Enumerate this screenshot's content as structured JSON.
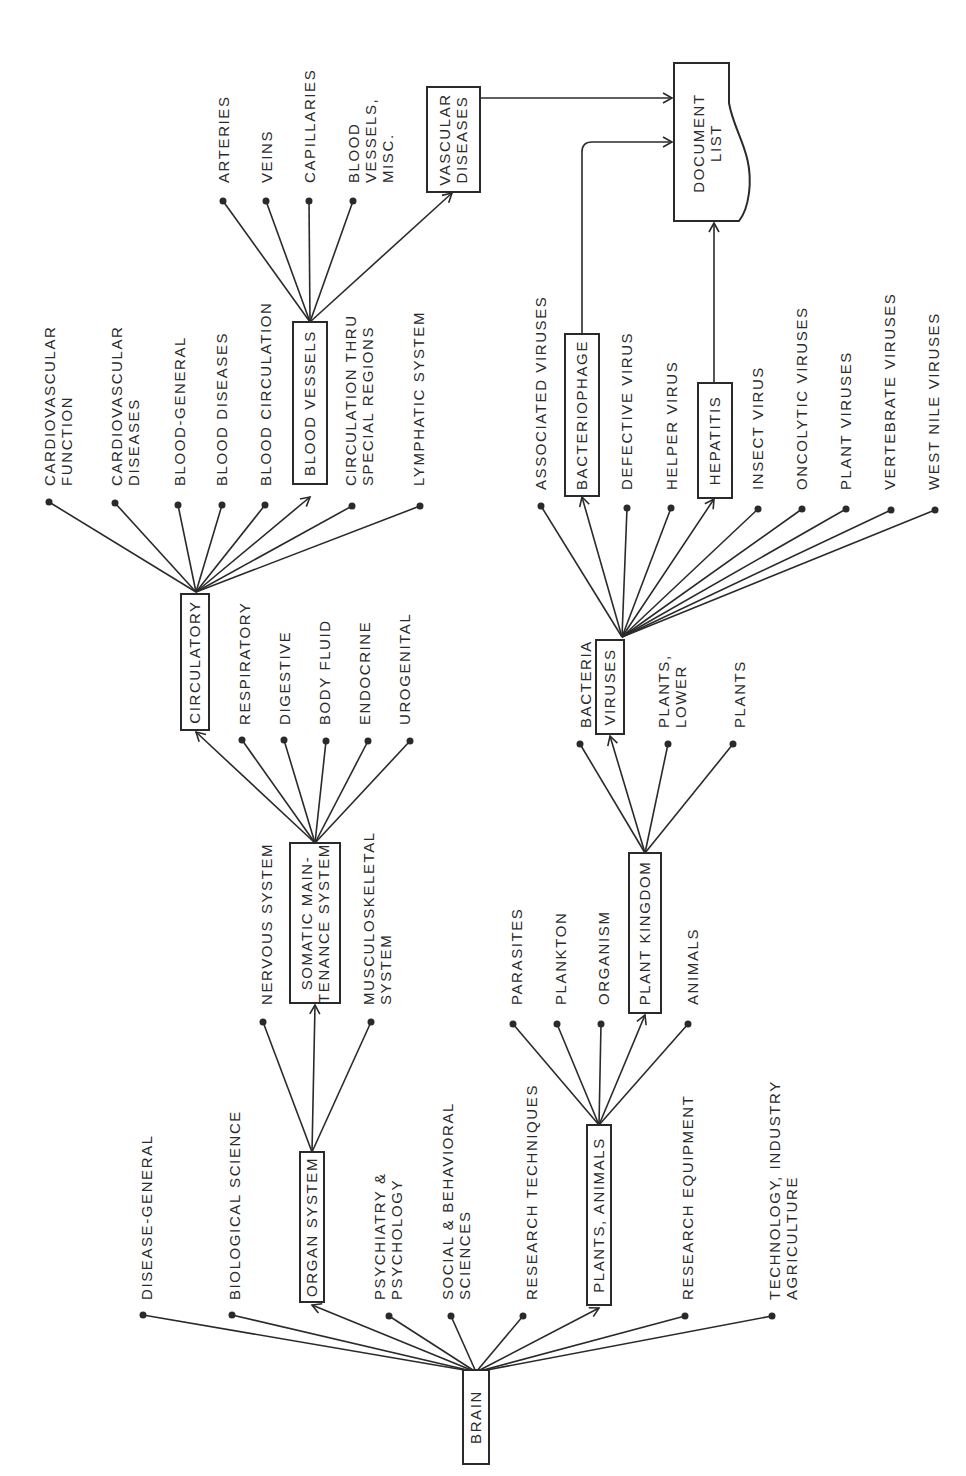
{
  "diagram": {
    "orientation": "rotated 90 degrees counter-clockwise",
    "root": {
      "id": "brain",
      "label": "BRAIN",
      "x": 476,
      "y": 1425
    },
    "boxed_nodes": [
      {
        "id": "brain",
        "lines": [
          "BRAIN"
        ],
        "x": 463,
        "y": 1370,
        "w": 26,
        "h": 94
      },
      {
        "id": "organ-system",
        "lines": [
          "ORGAN SYSTEM"
        ],
        "x": 300,
        "y": 1152,
        "w": 24,
        "h": 150
      },
      {
        "id": "plants-animals",
        "lines": [
          "PLANTS, ANIMALS"
        ],
        "x": 587,
        "y": 1125,
        "w": 24,
        "h": 180
      },
      {
        "id": "somatic",
        "lines": [
          "SOMATIC MAIN-",
          "TENANCE SYSTEM"
        ],
        "x": 290,
        "y": 843,
        "w": 50,
        "h": 160
      },
      {
        "id": "plant-kingdom",
        "lines": [
          "PLANT KINGDOM"
        ],
        "x": 629,
        "y": 853,
        "w": 32,
        "h": 160
      },
      {
        "id": "circulatory",
        "lines": [
          "CIRCULATORY"
        ],
        "x": 181,
        "y": 594,
        "w": 28,
        "h": 136
      },
      {
        "id": "viruses",
        "lines": [
          "VIRUSES"
        ],
        "x": 596,
        "y": 640,
        "w": 28,
        "h": 94
      },
      {
        "id": "blood-vessels",
        "lines": [
          "BLOOD VESSELS"
        ],
        "x": 293,
        "y": 322,
        "w": 34,
        "h": 162
      },
      {
        "id": "bacteriophage",
        "lines": [
          "BACTERIOPHAGE"
        ],
        "x": 565,
        "y": 334,
        "w": 34,
        "h": 162
      },
      {
        "id": "hepatitis",
        "lines": [
          "HEPATITIS"
        ],
        "x": 698,
        "y": 383,
        "w": 34,
        "h": 115
      },
      {
        "id": "vascular-diseases",
        "lines": [
          "VASCULAR",
          "DISEASES"
        ],
        "x": 427,
        "y": 87,
        "w": 53,
        "h": 105
      }
    ],
    "document_list": {
      "lines": [
        "DOCUMENT",
        "LIST"
      ],
      "x": 674,
      "y": 63,
      "w": 75,
      "h": 158
    },
    "groups": [
      {
        "parent": "brain",
        "hub": [
          476,
          1372
        ],
        "children": [
          {
            "lines": [
              "DISEASE-GENERAL"
            ],
            "tip": [
              143,
              1315
            ],
            "tx": 152,
            "ty": 1300
          },
          {
            "lines": [
              "BIOLOGICAL SCIENCE"
            ],
            "tip": [
              232,
              1315
            ],
            "tx": 240,
            "ty": 1300
          },
          {
            "box": "organ-system",
            "tip": [
              312,
              1305
            ],
            "arrow": true
          },
          {
            "lines": [
              "PSYCHIATRY &",
              "PSYCHOLOGY"
            ],
            "tip": [
              389,
              1316
            ],
            "tx": 385,
            "ty": 1300
          },
          {
            "lines": [
              "SOCIAL & BEHAVIORAL",
              "SCIENCES"
            ],
            "tip": [
              451,
              1316
            ],
            "tx": 453,
            "ty": 1300
          },
          {
            "lines": [
              "RESEARCH TECHNIQUES"
            ],
            "tip": [
              523,
              1316
            ],
            "tx": 537,
            "ty": 1300
          },
          {
            "box": "plants-animals",
            "tip": [
              599,
              1308
            ],
            "arrow": true
          },
          {
            "lines": [
              "RESEARCH EQUIPMENT"
            ],
            "tip": [
              685,
              1316
            ],
            "tx": 693,
            "ty": 1300
          },
          {
            "lines": [
              "TECHNOLOGY, INDUSTRY",
              "AGRICULTURE"
            ],
            "tip": [
              772,
              1316
            ],
            "tx": 780,
            "ty": 1300
          }
        ]
      },
      {
        "parent": "organ-system",
        "hub": [
          312,
          1152
        ],
        "children": [
          {
            "lines": [
              "NERVOUS SYSTEM"
            ],
            "tip": [
              263,
              1022
            ],
            "tx": 272,
            "ty": 1005
          },
          {
            "box": "somatic",
            "tip": [
              315,
              1005
            ],
            "arrow": true
          },
          {
            "lines": [
              "MUSCULOSKELETAL",
              "SYSTEM"
            ],
            "tip": [
              371,
              1022
            ],
            "tx": 374,
            "ty": 1005
          }
        ]
      },
      {
        "parent": "plants-animals",
        "hub": [
          599,
          1125
        ],
        "children": [
          {
            "lines": [
              "PARASITES"
            ],
            "tip": [
              513,
              1024
            ],
            "tx": 522,
            "ty": 1005
          },
          {
            "lines": [
              "PLANKTON"
            ],
            "tip": [
              557,
              1024
            ],
            "tx": 566,
            "ty": 1005
          },
          {
            "lines": [
              "ORGANISM"
            ],
            "tip": [
              601,
              1024
            ],
            "tx": 609,
            "ty": 1005
          },
          {
            "box": "plant-kingdom",
            "tip": [
              645,
              1015
            ],
            "arrow": true
          },
          {
            "lines": [
              "ANIMALS"
            ],
            "tip": [
              688,
              1024
            ],
            "tx": 698,
            "ty": 1005
          }
        ]
      },
      {
        "parent": "somatic",
        "hub": [
          315,
          843
        ],
        "children": [
          {
            "box": "circulatory",
            "tip": [
              196,
              732
            ],
            "arrow": true
          },
          {
            "lines": [
              "RESPIRATORY"
            ],
            "tip": [
              242,
              740
            ],
            "tx": 250,
            "ty": 725
          },
          {
            "lines": [
              "DIGESTIVE"
            ],
            "tip": [
              284,
              740
            ],
            "tx": 290,
            "ty": 725
          },
          {
            "lines": [
              "BODY FLUID"
            ],
            "tip": [
              326,
              741
            ],
            "tx": 330,
            "ty": 725
          },
          {
            "lines": [
              "ENDOCRINE"
            ],
            "tip": [
              368,
              741
            ],
            "tx": 370,
            "ty": 725
          },
          {
            "lines": [
              "UROGENITAL"
            ],
            "tip": [
              410,
              741
            ],
            "tx": 410,
            "ty": 725
          }
        ]
      },
      {
        "parent": "plant-kingdom",
        "hub": [
          645,
          853
        ],
        "children": [
          {
            "lines": [
              "BACTERIA"
            ],
            "tip": [
              580,
              744
            ],
            "tx": 591,
            "ty": 728
          },
          {
            "box": "viruses",
            "tip": [
              610,
              736
            ],
            "arrow": true
          },
          {
            "lines": [
              "PLANTS,",
              "LOWER"
            ],
            "tip": [
              668,
              744
            ],
            "tx": 669,
            "ty": 728
          },
          {
            "lines": [
              "PLANTS"
            ],
            "tip": [
              733,
              744
            ],
            "tx": 745,
            "ty": 728
          }
        ]
      },
      {
        "parent": "circulatory",
        "hub": [
          196,
          592
        ],
        "children": [
          {
            "lines": [
              "CARDIOVASCULAR",
              "FUNCTION"
            ],
            "tip": [
              49,
              502
            ],
            "tx": 55,
            "ty": 486
          },
          {
            "lines": [
              "CARDIOVASCULAR",
              "DISEASES"
            ],
            "tip": [
              115,
              503
            ],
            "tx": 122,
            "ty": 486
          },
          {
            "lines": [
              "BLOOD-GENERAL"
            ],
            "tip": [
              178,
              505
            ],
            "tx": 185,
            "ty": 486
          },
          {
            "lines": [
              "BLOOD DISEASES"
            ],
            "tip": [
              222,
              505
            ],
            "tx": 227,
            "ty": 486
          },
          {
            "lines": [
              "BLOOD CIRCULATION"
            ],
            "tip": [
              265,
              505
            ],
            "tx": 271,
            "ty": 486
          },
          {
            "box": "blood-vessels",
            "tip": [
              310,
              497
            ],
            "arrow": true
          },
          {
            "lines": [
              "CIRCULATION THRU",
              "SPECIAL REGIONS"
            ],
            "tip": [
              352,
              506
            ],
            "tx": 356,
            "ty": 486
          },
          {
            "lines": [
              "LYMPHATIC SYSTEM"
            ],
            "tip": [
              420,
              506
            ],
            "tx": 424,
            "ty": 486
          }
        ]
      },
      {
        "parent": "viruses",
        "hub": [
          622,
          637
        ],
        "children": [
          {
            "lines": [
              "ASSOCIATED VIRUSES"
            ],
            "tip": [
              541,
              506
            ],
            "tx": 546,
            "ty": 490
          },
          {
            "box": "bacteriophage",
            "tip": [
              582,
              497
            ],
            "arrow": true
          },
          {
            "lines": [
              "DEFECTIVE VIRUS"
            ],
            "tip": [
              627,
              508
            ],
            "tx": 632,
            "ty": 490
          },
          {
            "lines": [
              "HELPER VIRUS"
            ],
            "tip": [
              671,
              508
            ],
            "tx": 677,
            "ty": 490
          },
          {
            "box": "hepatitis",
            "tip": [
              714,
              499
            ],
            "arrow": true
          },
          {
            "lines": [
              "INSECT VIRUS"
            ],
            "tip": [
              758,
              509
            ],
            "tx": 763,
            "ty": 490
          },
          {
            "lines": [
              "ONCOLYTIC VIRUSES"
            ],
            "tip": [
              802,
              509
            ],
            "tx": 807,
            "ty": 490
          },
          {
            "lines": [
              "PLANT VIRUSES"
            ],
            "tip": [
              846,
              509
            ],
            "tx": 851,
            "ty": 490
          },
          {
            "lines": [
              "VERTEBRATE VIRUSES"
            ],
            "tip": [
              891,
              510
            ],
            "tx": 895,
            "ty": 490
          },
          {
            "lines": [
              "WEST NILE VIRUSES"
            ],
            "tip": [
              935,
              510
            ],
            "tx": 939,
            "ty": 490
          }
        ]
      },
      {
        "parent": "blood-vessels",
        "hub": [
          310,
          322
        ],
        "children": [
          {
            "lines": [
              "ARTERIES"
            ],
            "tip": [
              223,
              201
            ],
            "tx": 229,
            "ty": 183
          },
          {
            "lines": [
              "VEINS"
            ],
            "tip": [
              266,
              201
            ],
            "tx": 272,
            "ty": 183
          },
          {
            "lines": [
              "CAPILLARIES"
            ],
            "tip": [
              309,
              201
            ],
            "tx": 315,
            "ty": 183
          },
          {
            "lines": [
              "BLOOD",
              "VESSELS,",
              "MISC."
            ],
            "tip": [
              353,
              201
            ],
            "tx": 359,
            "ty": 183
          },
          {
            "box": "vascular-diseases",
            "tip": [
              452,
              193
            ],
            "arrow": true
          }
        ]
      }
    ],
    "connectors_to_document_list": [
      {
        "from": "vascular-diseases",
        "path": "M480 98 L672 98"
      },
      {
        "from": "bacteriophage",
        "path": "M582 334 L582 152 Q582 142 592 142 L672 142"
      },
      {
        "from": "hepatitis",
        "path": "M714 383 L714 223"
      }
    ]
  }
}
